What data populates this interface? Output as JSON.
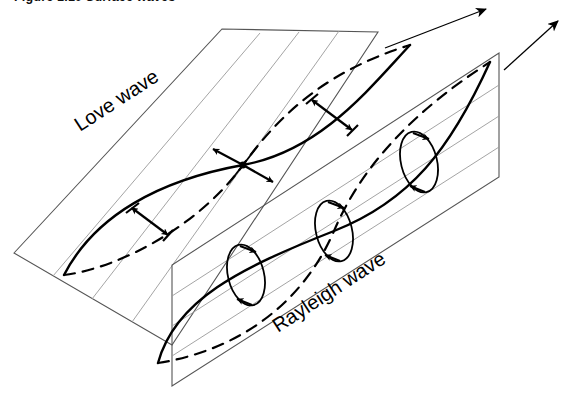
{
  "figure": {
    "caption": "Figure 1.10   Surface waves",
    "labels": {
      "love_wave": "Love wave",
      "rayleigh_wave": "Rayleigh wave"
    },
    "colors": {
      "background": "#ffffff",
      "stroke": "#000000",
      "plane_edge": "#555555",
      "axis_line": "#8a8a8a"
    }
  },
  "diagram": {
    "type": "seismic-surface-wave-schematic",
    "planes": [
      {
        "name": "horizontal-plane",
        "wave": "Love wave",
        "orientation": "horizontal",
        "corners": [
          [
            14,
            253
          ],
          [
            172,
            345
          ],
          [
            378,
            32
          ],
          [
            222,
            29
          ]
        ]
      },
      {
        "name": "vertical-plane",
        "wave": "Rayleigh wave",
        "orientation": "vertical",
        "corners": [
          [
            172,
            265
          ],
          [
            172,
            386
          ],
          [
            499,
            53
          ],
          [
            499,
            177
          ]
        ]
      }
    ],
    "propagation_arrows": [
      {
        "name": "love-wave-propagation-arrow",
        "from": [
          385,
          48
        ],
        "to": [
          488,
          8
        ]
      },
      {
        "name": "rayleigh-wave-propagation-arrow",
        "from": [
          504,
          70
        ],
        "to": [
          560,
          19
        ]
      }
    ],
    "love_wave_markers": [
      {
        "name": "transverse-arrow-pair-left",
        "at": [
          135,
          213
        ]
      },
      {
        "name": "node-cross-arrows",
        "at": [
          243,
          165
        ]
      },
      {
        "name": "transverse-arrow-pair-right",
        "at": [
          318,
          95
        ]
      }
    ],
    "rayleigh_ellipses": [
      {
        "name": "particle-motion-ellipse-1",
        "center": [
          246,
          275
        ],
        "rx": 18,
        "ry": 31
      },
      {
        "name": "particle-motion-ellipse-2",
        "center": [
          334,
          231
        ],
        "rx": 18,
        "ry": 31
      },
      {
        "name": "particle-motion-ellipse-3",
        "center": [
          419,
          162
        ],
        "rx": 18,
        "ry": 31
      }
    ]
  }
}
